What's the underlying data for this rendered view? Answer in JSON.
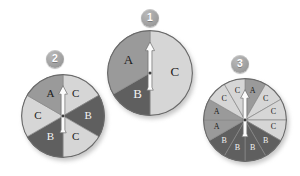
{
  "page": {
    "background_color": "#ffffff"
  },
  "palette": {
    "sector_a": "#9a9a9a",
    "sector_b": "#5f5f5f",
    "sector_c": "#d6d6d6",
    "outline": "#6a6a6a",
    "divider": "#8a8a8a",
    "needle_fill": "#fbfbfb",
    "needle_stroke": "#6f6f6f",
    "badge_text": "#ffffff",
    "label_dark": "#1b1b1b",
    "label_light": "#f2f2f2"
  },
  "spinners": [
    {
      "id": "spinner-1",
      "badge_label": "1",
      "badge": {
        "cx": 150,
        "cy": 18,
        "r": 9
      },
      "center": {
        "cx": 150,
        "cy": 73
      },
      "radius": 43,
      "needle": {
        "angle_deg": 0,
        "direction": "up"
      },
      "sector_count": 3,
      "sectors": [
        {
          "label": "C",
          "start_deg": 0,
          "end_deg": 180,
          "fill_key": "sector_c",
          "text_tone": "dark"
        },
        {
          "label": "B",
          "start_deg": 180,
          "end_deg": 240,
          "fill_key": "sector_b",
          "text_tone": "light"
        },
        {
          "label": "A",
          "start_deg": 240,
          "end_deg": 360,
          "fill_key": "sector_a",
          "text_tone": "dark"
        }
      ]
    },
    {
      "id": "spinner-2",
      "badge_label": "2",
      "badge": {
        "cx": 55,
        "cy": 59,
        "r": 9
      },
      "center": {
        "cx": 63,
        "cy": 116
      },
      "radius": 42,
      "needle": {
        "angle_deg": 0,
        "direction": "up"
      },
      "sector_count": 6,
      "sectors": [
        {
          "label": "C",
          "start_deg": 0,
          "end_deg": 60,
          "fill_key": "sector_c",
          "text_tone": "dark"
        },
        {
          "label": "B",
          "start_deg": 60,
          "end_deg": 120,
          "fill_key": "sector_b",
          "text_tone": "light"
        },
        {
          "label": "C",
          "start_deg": 120,
          "end_deg": 180,
          "fill_key": "sector_c",
          "text_tone": "dark"
        },
        {
          "label": "B",
          "start_deg": 180,
          "end_deg": 240,
          "fill_key": "sector_b",
          "text_tone": "light"
        },
        {
          "label": "C",
          "start_deg": 240,
          "end_deg": 300,
          "fill_key": "sector_c",
          "text_tone": "dark"
        },
        {
          "label": "A",
          "start_deg": 300,
          "end_deg": 360,
          "fill_key": "sector_a",
          "text_tone": "dark"
        }
      ]
    },
    {
      "id": "spinner-3",
      "badge_label": "3",
      "badge": {
        "cx": 240,
        "cy": 64
      },
      "badge_r": 9,
      "center": {
        "cx": 245,
        "cy": 120
      },
      "radius": 42,
      "needle": {
        "angle_deg": 0,
        "direction": "up"
      },
      "sector_count": 12,
      "sectors": [
        {
          "label": "A",
          "start_deg": 0,
          "end_deg": 30,
          "fill_key": "sector_a",
          "text_tone": "dark"
        },
        {
          "label": "C",
          "start_deg": 30,
          "end_deg": 60,
          "fill_key": "sector_c",
          "text_tone": "dark"
        },
        {
          "label": "C",
          "start_deg": 60,
          "end_deg": 90,
          "fill_key": "sector_c",
          "text_tone": "dark"
        },
        {
          "label": "C",
          "start_deg": 90,
          "end_deg": 120,
          "fill_key": "sector_c",
          "text_tone": "dark"
        },
        {
          "label": "B",
          "start_deg": 120,
          "end_deg": 150,
          "fill_key": "sector_b",
          "text_tone": "light"
        },
        {
          "label": "B",
          "start_deg": 150,
          "end_deg": 180,
          "fill_key": "sector_b",
          "text_tone": "light"
        },
        {
          "label": "B",
          "start_deg": 180,
          "end_deg": 210,
          "fill_key": "sector_b",
          "text_tone": "light"
        },
        {
          "label": "B",
          "start_deg": 210,
          "end_deg": 240,
          "fill_key": "sector_b",
          "text_tone": "light"
        },
        {
          "label": "A",
          "start_deg": 240,
          "end_deg": 270,
          "fill_key": "sector_a",
          "text_tone": "dark"
        },
        {
          "label": "A",
          "start_deg": 270,
          "end_deg": 300,
          "fill_key": "sector_a",
          "text_tone": "dark"
        },
        {
          "label": "C",
          "start_deg": 300,
          "end_deg": 330,
          "fill_key": "sector_c",
          "text_tone": "dark"
        },
        {
          "label": "C",
          "start_deg": 330,
          "end_deg": 360,
          "fill_key": "sector_c",
          "text_tone": "dark"
        }
      ]
    }
  ]
}
